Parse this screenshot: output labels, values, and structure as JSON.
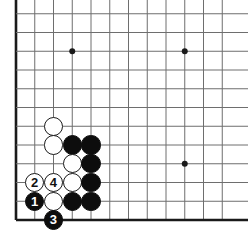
{
  "diagram": {
    "kind": "go-board-diagram",
    "board_size": 19,
    "view": "bottom-left corner",
    "colors": {
      "background": "#ffffff",
      "grid_line": "#6e6e6e",
      "border_line": "#1a1a1a",
      "black_stone": "#0d0d0d",
      "white_stone": "#ffffff",
      "white_stone_outline": "#1a1a1a",
      "star_point": "#1a1a1a"
    },
    "geometry": {
      "origin_x": 16,
      "origin_y": 220,
      "spacing": 18.75,
      "columns_visible": 12,
      "rows_visible": 12,
      "stone_radius": 9.6
    }
  },
  "grid": {
    "vertical_x": [
      16,
      34.75,
      53.5,
      72.25,
      91,
      109.75,
      128.5,
      147.25,
      166,
      184.75,
      203.5,
      222.25
    ],
    "horizontal_y": [
      220,
      201.25,
      182.5,
      163.75,
      145,
      126.25,
      107.5,
      88.75,
      70,
      51.25,
      32.5,
      13.75
    ],
    "left_border_x": 16,
    "bottom_border_y": 220
  },
  "star_points": [
    {
      "name": "star-point-upper-left",
      "x": 72.25,
      "y": 51.25
    },
    {
      "name": "star-point-upper-right",
      "x": 184.75,
      "y": 51.25
    },
    {
      "name": "star-point-center-right",
      "x": 184.75,
      "y": 163.75
    }
  ],
  "stones": [
    {
      "id": "white-a",
      "color": "white",
      "label": "",
      "x": 53.5,
      "y": 126.25
    },
    {
      "id": "white-b",
      "color": "white",
      "label": "",
      "x": 53.5,
      "y": 145
    },
    {
      "id": "black-a",
      "color": "black",
      "label": "",
      "x": 72.25,
      "y": 145
    },
    {
      "id": "black-b",
      "color": "black",
      "label": "",
      "x": 91,
      "y": 145
    },
    {
      "id": "white-c",
      "color": "white",
      "label": "",
      "x": 72.25,
      "y": 163.75
    },
    {
      "id": "black-c",
      "color": "black",
      "label": "",
      "x": 91,
      "y": 163.75
    },
    {
      "id": "white-2",
      "color": "white",
      "label": "2",
      "x": 34.75,
      "y": 182.5
    },
    {
      "id": "white-4",
      "color": "white",
      "label": "4",
      "x": 53.5,
      "y": 182.5
    },
    {
      "id": "white-d",
      "color": "white",
      "label": "",
      "x": 72.25,
      "y": 182.5
    },
    {
      "id": "black-d",
      "color": "black",
      "label": "",
      "x": 91,
      "y": 182.5
    },
    {
      "id": "black-1",
      "color": "black",
      "label": "1",
      "x": 34.75,
      "y": 201.25
    },
    {
      "id": "white-e",
      "color": "white",
      "label": "",
      "x": 53.5,
      "y": 201.25
    },
    {
      "id": "black-e",
      "color": "black",
      "label": "",
      "x": 72.25,
      "y": 201.25
    },
    {
      "id": "black-f",
      "color": "black",
      "label": "",
      "x": 91,
      "y": 201.25
    },
    {
      "id": "black-3",
      "color": "black",
      "label": "3",
      "x": 53.5,
      "y": 220
    }
  ],
  "move_sequence": [
    {
      "number": "1",
      "color": "black"
    },
    {
      "number": "2",
      "color": "white"
    },
    {
      "number": "3",
      "color": "black"
    },
    {
      "number": "4",
      "color": "white"
    }
  ]
}
